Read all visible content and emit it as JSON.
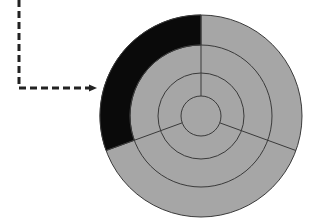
{
  "diagram": {
    "type": "segmented-ring-diagram",
    "colors": {
      "background": "#ffffff",
      "segment_fill": "#a6a6a6",
      "highlight_fill": "#0a0a0a",
      "stroke": "#3a3a3a",
      "arrow": "#222222"
    },
    "center": [
      201,
      116
    ],
    "ring_radii": [
      20,
      43,
      71,
      101
    ],
    "dividers_deg_from_top": [
      0,
      110,
      250
    ],
    "highlighted_segment": {
      "ring": "outer",
      "from_deg": 250,
      "to_deg": 360,
      "color": "#0a0a0a"
    },
    "pointer_arrow": {
      "style": "dashed",
      "points": [
        [
          19,
          0
        ],
        [
          19,
          88
        ],
        [
          101,
          88
        ]
      ],
      "points_to": "highlighted-outer-segment"
    }
  }
}
